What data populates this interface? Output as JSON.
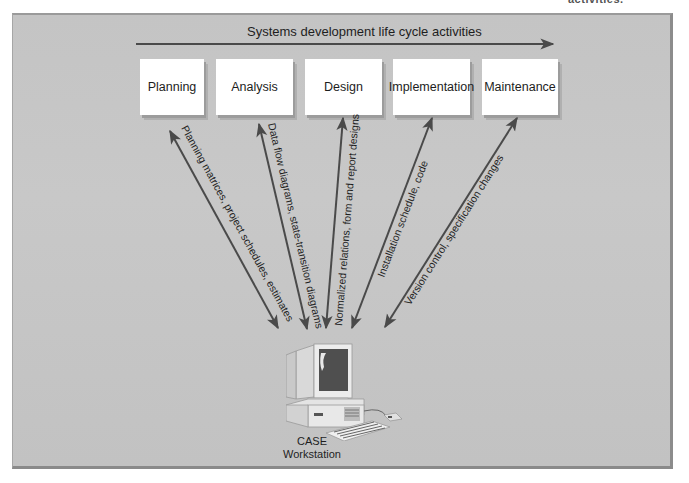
{
  "corner_text": "activities.",
  "diagram": {
    "title": "Systems development life cycle activities",
    "phases": [
      {
        "label": "Planning",
        "x": 140,
        "w": 64
      },
      {
        "label": "Analysis",
        "x": 216,
        "w": 77
      },
      {
        "label": "Design",
        "x": 305,
        "w": 77
      },
      {
        "label": "Implementation",
        "x": 393,
        "w": 77
      },
      {
        "label": "Maintenance",
        "x": 482,
        "w": 76
      }
    ],
    "connections": [
      {
        "from": "Planning",
        "to": "CASE Workstation",
        "label": "Planning matrices, project schedules, estimates"
      },
      {
        "from": "Analysis",
        "to": "CASE Workstation",
        "label": "Data flow diagrams, state-transition diagrams"
      },
      {
        "from": "Design",
        "to": "CASE Workstation",
        "label": "Normalized relations, form and report designs"
      },
      {
        "from": "Implementation",
        "to": "CASE Workstation",
        "label": "Installation schedule, code"
      },
      {
        "from": "Maintenance",
        "to": "CASE Workstation",
        "label": "Version control, specification changes"
      }
    ],
    "workstation": {
      "line1": "CASE",
      "line2": "Workstation"
    },
    "colors": {
      "panel": "#c6c6c6",
      "arrow": "#4a4a4a",
      "box": "#ffffff",
      "text": "#1e1e1e"
    }
  }
}
